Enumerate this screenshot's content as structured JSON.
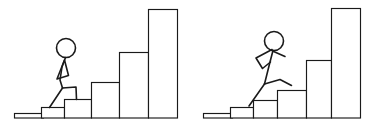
{
  "canvas": {
    "width": 371,
    "height": 131,
    "background_color": "#ffffff",
    "ink_color": "#1a1a1a",
    "description": "Two-panel line drawing: a stick figure climbing a rising staircase of bars on the left, and a stick figure running up a rising staircase of bars on the right."
  },
  "panels": [
    {
      "id": "left-panel",
      "name": "climbing-panel",
      "figure": {
        "name": "stick-figure-climbing",
        "pose": "climbing",
        "head_radius": 9.5,
        "head_center": [
          66,
          48
        ],
        "parts": [
          "head",
          "neck",
          "torso",
          "bent-arm-triangle",
          "back-leg",
          "front-leg"
        ]
      },
      "ground": {
        "x": 14,
        "y": 113,
        "width": 30,
        "height": 5
      },
      "bars": [
        {
          "x": 41,
          "y": 107,
          "width": 24,
          "height": 11
        },
        {
          "x": 64,
          "y": 99,
          "width": 28,
          "height": 19
        },
        {
          "x": 91,
          "y": 82,
          "width": 29,
          "height": 36
        },
        {
          "x": 119,
          "y": 52,
          "width": 30,
          "height": 66
        },
        {
          "x": 148,
          "y": 9,
          "width": 30,
          "height": 109
        }
      ],
      "bar_heights": [
        11,
        19,
        36,
        66,
        109
      ]
    },
    {
      "id": "right-panel",
      "name": "running-panel",
      "figure": {
        "name": "stick-figure-running",
        "pose": "running",
        "head_radius": 9.5,
        "head_center": [
          274,
          41
        ],
        "parts": [
          "head",
          "neck",
          "torso",
          "back-arm-bent",
          "front-arm",
          "back-leg",
          "front-leg"
        ]
      },
      "ground": {
        "x": 203,
        "y": 113,
        "width": 30,
        "height": 5
      },
      "bars": [
        {
          "x": 230,
          "y": 107,
          "width": 24,
          "height": 11
        },
        {
          "x": 253,
          "y": 100,
          "width": 25,
          "height": 18
        },
        {
          "x": 277,
          "y": 90,
          "width": 30,
          "height": 28
        },
        {
          "x": 306,
          "y": 60,
          "width": 26,
          "height": 58
        },
        {
          "x": 331,
          "y": 8,
          "width": 30,
          "height": 110
        }
      ],
      "bar_heights": [
        11,
        18,
        28,
        58,
        110
      ]
    }
  ],
  "chart_data": {
    "type": "bar",
    "title": "",
    "xlabel": "",
    "ylabel": "",
    "grid": false,
    "legend": "none",
    "categories": [
      "1",
      "2",
      "3",
      "4",
      "5"
    ],
    "series": [
      {
        "name": "left-staircase",
        "values": [
          11,
          19,
          36,
          66,
          109
        ]
      },
      {
        "name": "right-staircase",
        "values": [
          11,
          18,
          28,
          58,
          110
        ]
      }
    ],
    "ylim": [
      0,
      118
    ]
  }
}
